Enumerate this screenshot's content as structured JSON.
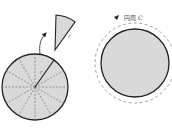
{
  "diagram": {
    "left_figure": {
      "description": "Circle divided into 12 sectors with dashed radii; one sector removed",
      "radius_label": "r",
      "sector_count": 12,
      "fill_color": "#d9d9d9",
      "stroke_color": "#222222"
    },
    "detached_sector": {
      "label": "r"
    },
    "right_figure": {
      "description": "Circle with dashed circumference path arrow",
      "circumference_label": "円周 C",
      "fill_color": "#d9d9d9",
      "stroke_color": "#222222"
    }
  }
}
